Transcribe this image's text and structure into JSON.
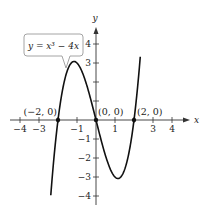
{
  "chart_data": {
    "type": "line",
    "title": "",
    "function": "y = x^3 - 4x",
    "equation_label": "y = x³ − 4x",
    "xlabel": "x",
    "ylabel": "y",
    "xlim": [
      -4.5,
      4.7
    ],
    "ylim": [
      -4.5,
      4.7
    ],
    "grid": false,
    "x_ticks": [
      -4,
      -3,
      -1,
      1,
      3,
      4
    ],
    "x_tick_labels": [
      "−4",
      "−3",
      "−1",
      "1",
      "3",
      "4"
    ],
    "y_ticks": [
      4,
      3,
      -1,
      -2,
      -3,
      -4
    ],
    "y_tick_labels": [
      "4",
      "3",
      "−1",
      "−2",
      "−3",
      "−4"
    ],
    "points": [
      {
        "x": -2,
        "y": 0,
        "label": "(−2, 0)"
      },
      {
        "x": 0,
        "y": 0,
        "label": "(0, 0)"
      },
      {
        "x": 2,
        "y": 0,
        "label": "(2, 0)"
      }
    ],
    "series": [
      {
        "name": "y = x^3 - 4x",
        "x_range": [
          -2.38,
          2.33
        ]
      }
    ]
  }
}
